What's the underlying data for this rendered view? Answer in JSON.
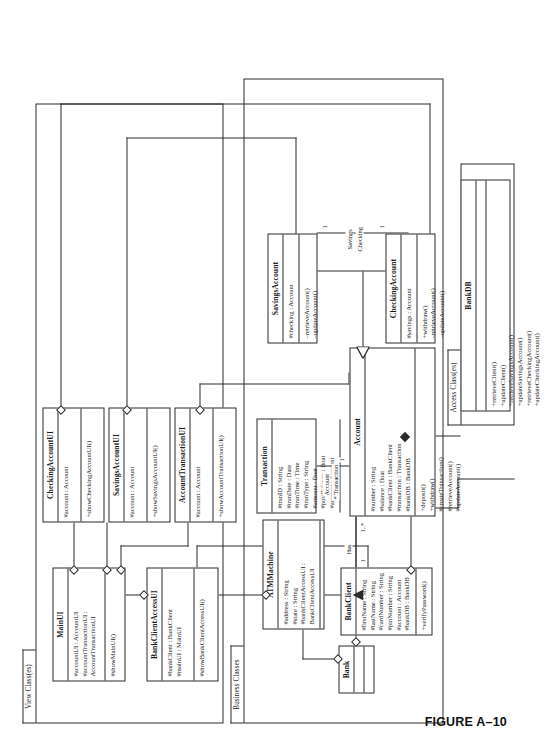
{
  "figure": {
    "caption": "FIGURE A–10"
  },
  "packages": [
    {
      "id": "view",
      "label": "View Class(es)"
    },
    {
      "id": "business",
      "label": "Business Classes"
    },
    {
      "id": "access",
      "label": "Access Class(es)"
    }
  ],
  "classes": {
    "main_ui": {
      "name": "MainUI",
      "attributes": [
        "#accountUI : AccountUI",
        "#accountTransactionUI :",
        "AccountTransactionUI"
      ],
      "operations": [
        "#showMainUI()"
      ]
    },
    "bank_client_access_ui": {
      "name": "BankClientAccessUI",
      "attributes": [
        "#bankClient : BankClient",
        "#mainUI : MainUI"
      ],
      "operations": [
        "#showBankClientAccessUI()"
      ]
    },
    "checking_account_ui": {
      "name": "CheckingAccountUI",
      "attributes": [
        "#account : Account"
      ],
      "operations": [
        "+showCheckingAccountUI()"
      ]
    },
    "savings_account_ui": {
      "name": "SavingsAccountUI",
      "attributes": [
        "#account : Account"
      ],
      "operations": [
        "+showSavingsAccountUI()"
      ]
    },
    "account_transaction_ui": {
      "name": "AccountTransactionUI",
      "attributes": [
        "#account : Account"
      ],
      "operations": [
        "+showAccountTransactionUI()"
      ]
    },
    "bank": {
      "name": "Bank",
      "attributes": [],
      "operations": []
    },
    "atm_machine": {
      "name": "ATMMachine",
      "attributes": [
        "#address : String",
        "#state : String",
        "#bankClientAccessUI :",
        "BankClientAccessUI"
      ],
      "operations": []
    },
    "bank_client": {
      "name": "BankClient",
      "attributes": [
        "#firstName : String",
        "#lastName : String",
        "#cardNumber : String",
        "#pinNumber : String",
        "#account : Account",
        "#bankDB : BankDB"
      ],
      "operations": [
        "+verifyPassword()"
      ]
    },
    "transaction": {
      "name": "Transaction",
      "attributes": [
        "#tranID : String",
        "#tranDate : Date",
        "#tranTime : Time",
        "#tranType : String",
        "#amount : float",
        "#postBalance : float",
        "#account : Account"
      ],
      "operations": []
    },
    "account": {
      "name": "Account",
      "attributes": [
        "#number : String",
        "#balance : float",
        "#bankClient : BankClient",
        "#transaction : Transaction",
        "#bankDB : BankDB"
      ],
      "operations": [
        "+deposit()",
        "+withdraw()",
        "#createTransaction()",
        "#retrieveAccount()",
        "#updateAccount()"
      ]
    },
    "savings_account": {
      "name": "SavingsAccount",
      "attributes": [
        "#checking : Account"
      ],
      "operations": [
        "–retrieveAccount()",
        "–updateAccount()"
      ]
    },
    "checking_account": {
      "name": "CheckingAccount",
      "attributes": [
        "#savings : Account"
      ],
      "operations": [
        "+withdraw()",
        "–retrieveAccount()",
        "–updateAccount()"
      ]
    },
    "bank_db": {
      "name": "BankDB",
      "attributes": [],
      "operations": [
        "+retrieveClient()",
        "+updateClient()",
        "+retrieveSavingsAccount()",
        "+updateSavingsAccount()",
        "+retrieveCheckingAccount()",
        "+updateCheckingAccount()"
      ]
    }
  },
  "association_labels": {
    "has": "Has",
    "bank_client_mult": "1",
    "account_mult": "1..*",
    "account_transaction_role_line1": "Account",
    "account_transaction_role_line2": "* Transaction",
    "transaction_mult": "1",
    "savings_role": "Savings",
    "checking_role": "Checking",
    "savings_mult": "1",
    "checking_mult": "1"
  }
}
